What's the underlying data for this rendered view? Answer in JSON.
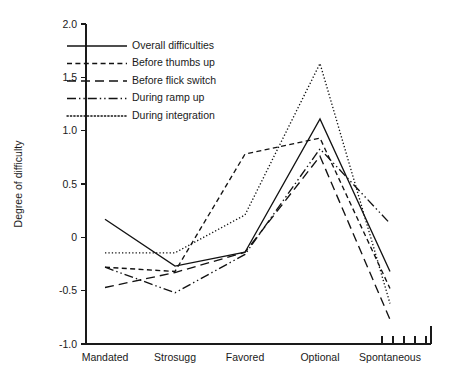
{
  "chart_data": {
    "type": "line",
    "title": "",
    "xlabel": "",
    "ylabel": "Degree of difficulty",
    "categories": [
      "Mandated",
      "Strosugg",
      "Favored",
      "Optional",
      "Spontaneous"
    ],
    "ylim": [
      -1.0,
      2.0
    ],
    "ytick_labels": [
      "2.0",
      "1.5",
      "1.0",
      "0.5",
      "0",
      "-0.5",
      "-1.0"
    ],
    "ytick_values": [
      2.0,
      1.5,
      1.0,
      0.5,
      0,
      -0.5,
      -1.0
    ],
    "grid": false,
    "legend_position": "upper-left-inside",
    "series": [
      {
        "name": "Overall difficulties",
        "dash": "none",
        "values": [
          0.17,
          -0.27,
          -0.14,
          1.11,
          -0.32
        ]
      },
      {
        "name": "Before thumbs up",
        "dash": "short-dash",
        "values": [
          -0.28,
          -0.32,
          0.78,
          0.93,
          -0.48
        ]
      },
      {
        "name": "Before flick switch",
        "dash": "long-dash",
        "values": [
          -0.47,
          -0.33,
          -0.14,
          0.76,
          -0.77
        ]
      },
      {
        "name": "During ramp up",
        "dash": "dash-dot-dot",
        "values": [
          -0.28,
          -0.52,
          -0.16,
          0.83,
          0.13
        ]
      },
      {
        "name": "During integration",
        "dash": "dotted",
        "values": [
          -0.145,
          -0.145,
          0.21,
          1.63,
          -0.62
        ]
      }
    ],
    "stray_ticks": {
      "count": 5,
      "location": "bottom-axis-right",
      "description": "five short tick marks on the bottom axis near the Spontaneous label"
    }
  },
  "colors": {
    "ink": "#121212",
    "background": "#ffffff"
  }
}
